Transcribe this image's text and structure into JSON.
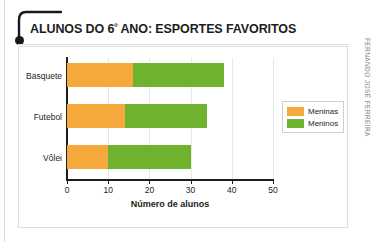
{
  "title": {
    "prefix": "ALUNOS DO 6",
    "ordinal": "º",
    "suffix": " ANO: ESPORTES FAVORITOS",
    "full": "ALUNOS DO 6º ANO: ESPORTES FAVORITOS"
  },
  "credit": "FERNANDO JOSÉ FERREIRA",
  "colors": {
    "meninas": "#F5A93C",
    "meninos": "#6EB22E",
    "axis": "#1D1D1B",
    "grid": "#E8E8E8",
    "panel_border": "#DEDEDE"
  },
  "legend": {
    "position": "right",
    "entries": [
      {
        "label": "Meninas",
        "color": "#F5A93C"
      },
      {
        "label": "Meninos",
        "color": "#6EB22E"
      }
    ]
  },
  "chart_data": {
    "type": "bar",
    "orientation": "horizontal",
    "stacked": true,
    "title": "ALUNOS DO 6º ANO: ESPORTES FAVORITOS",
    "xlabel": "Número de alunos",
    "ylabel": "",
    "categories": [
      "Basquete",
      "Futebol",
      "Vôlei"
    ],
    "series": [
      {
        "name": "Meninas",
        "color": "#F5A93C",
        "values": [
          16,
          14,
          10
        ]
      },
      {
        "name": "Meninos",
        "color": "#6EB22E",
        "values": [
          22,
          20,
          20
        ]
      }
    ],
    "totals": [
      38,
      34,
      30
    ],
    "xlim": [
      0,
      50
    ],
    "xticks": [
      0,
      10,
      20,
      30,
      40,
      50
    ],
    "xtick_labels": [
      "0",
      "10",
      "20",
      "30",
      "40",
      "50"
    ],
    "grid": "vertical"
  }
}
